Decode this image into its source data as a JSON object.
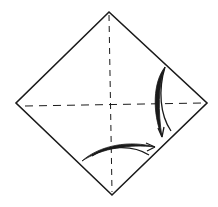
{
  "diagram": {
    "type": "origami-fold-step",
    "shape": "square-diamond",
    "colors": {
      "line": "#1a1a1a",
      "background": "#ffffff"
    },
    "creases": [
      {
        "name": "vertical-valley-fold",
        "style": "dashed"
      },
      {
        "name": "horizontal-valley-fold",
        "style": "dashed"
      }
    ],
    "arrows": [
      {
        "name": "right-fold-arrow",
        "direction": "downward curve toward lower-right edge"
      },
      {
        "name": "bottom-fold-arrow",
        "direction": "rightward curve toward lower-right edge"
      }
    ]
  }
}
